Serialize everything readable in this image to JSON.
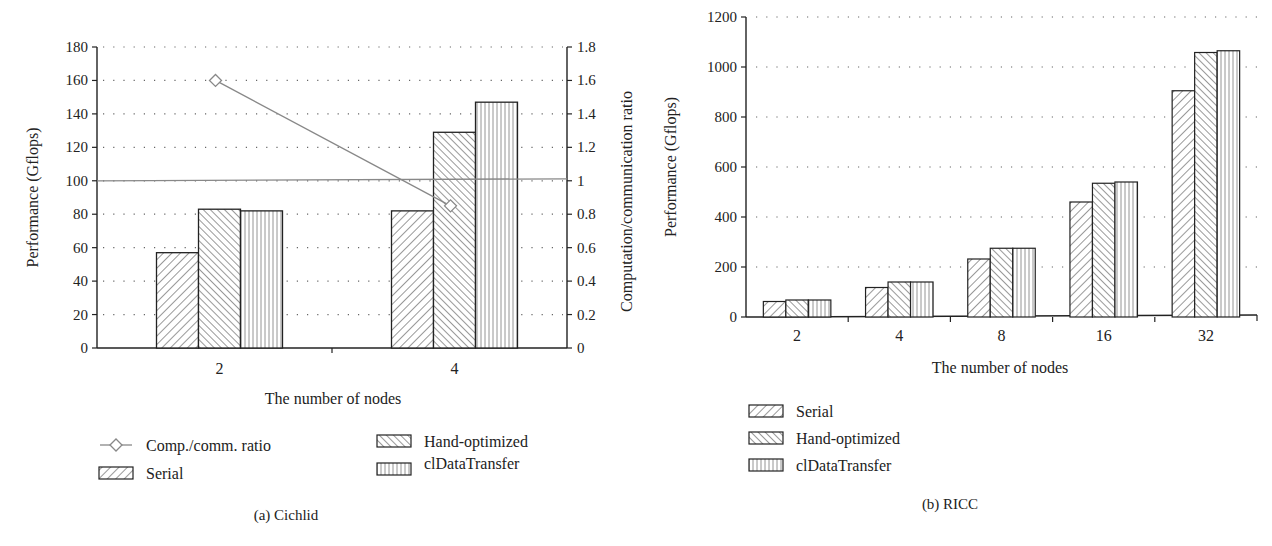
{
  "chart_data": [
    {
      "type": "bar",
      "panel_label": "(a)  Cichlid",
      "xlabel": "The number of nodes",
      "ylabel": "Performance (Gflops)",
      "y2label": "Computation/communication ratio",
      "categories": [
        "2",
        "4"
      ],
      "ylim": [
        0,
        180
      ],
      "yticks": [
        0,
        20,
        40,
        60,
        80,
        100,
        120,
        140,
        160,
        180
      ],
      "y2lim": [
        0,
        1.8
      ],
      "y2ticks": [
        "0",
        "0.2",
        "0.4",
        "0.6",
        "0.8",
        "1",
        "1.2",
        "1.4",
        "1.6",
        "1.8"
      ],
      "grid": "dotted horizontal",
      "series": [
        {
          "name": "Serial",
          "pattern": "backslash-hatch",
          "values": [
            57,
            82
          ]
        },
        {
          "name": "Hand-optimized",
          "pattern": "slash-hatch",
          "values": [
            83,
            129
          ]
        },
        {
          "name": "clDataTransfer",
          "pattern": "vertical-lines",
          "values": [
            82,
            147
          ]
        },
        {
          "name": "Comp./comm. ratio",
          "type": "line",
          "marker": "diamond",
          "axis": "right",
          "values": [
            1.6,
            0.85
          ]
        }
      ],
      "reference_line": {
        "axis": "right",
        "value": 1
      },
      "legend": [
        "Comp./comm. ratio",
        "Serial",
        "Hand-optimized",
        "clDataTransfer"
      ],
      "legend_position": "bottom"
    },
    {
      "type": "bar",
      "panel_label": "(b)  RICC",
      "xlabel": "The number of nodes",
      "ylabel": "Performance (Gflops)",
      "categories": [
        "2",
        "4",
        "8",
        "16",
        "32"
      ],
      "ylim": [
        0,
        1200
      ],
      "yticks": [
        0,
        200,
        400,
        600,
        800,
        1000,
        1200
      ],
      "grid": "dotted horizontal",
      "series": [
        {
          "name": "Serial",
          "pattern": "backslash-hatch",
          "values": [
            62,
            118,
            232,
            460,
            905
          ]
        },
        {
          "name": "Hand-optimized",
          "pattern": "slash-hatch",
          "values": [
            68,
            140,
            275,
            535,
            1058
          ]
        },
        {
          "name": "clDataTransfer",
          "pattern": "vertical-lines",
          "values": [
            68,
            140,
            275,
            540,
            1065
          ]
        }
      ],
      "legend": [
        "Serial",
        "Hand-optimized",
        "clDataTransfer"
      ],
      "legend_position": "bottom-left"
    }
  ],
  "left": {
    "ylabel": "Performance (Gflops)",
    "y2label": "Computation/communication ratio",
    "xlabel": "The number of nodes",
    "caption": "(a)  Cichlid",
    "legend": {
      "ratio": "Comp./comm. ratio",
      "serial": "Serial",
      "hand": "Hand-optimized",
      "cl": "clDataTransfer"
    }
  },
  "right": {
    "ylabel": "Performance (Gflops)",
    "xlabel": "The number of nodes",
    "caption": "(b)  RICC",
    "legend": {
      "serial": "Serial",
      "hand": "Hand-optimized",
      "cl": "clDataTransfer"
    }
  }
}
